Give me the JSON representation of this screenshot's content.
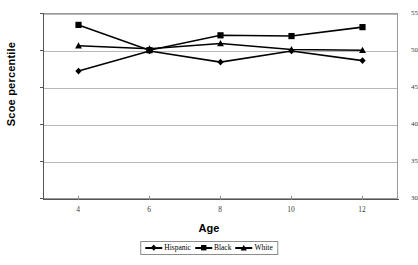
{
  "chart_data": {
    "type": "line",
    "title": "",
    "xlabel": "Age",
    "ylabel": "Scoe percentile",
    "x": [
      4,
      6,
      8,
      10,
      12
    ],
    "xticklabels": [
      "4",
      "6",
      "8",
      "10",
      "12"
    ],
    "yticklabels": [
      "30",
      "35",
      "40",
      "45",
      "50",
      "55"
    ],
    "yticks": [
      30,
      35,
      40,
      45,
      50,
      55
    ],
    "ylim": [
      30,
      55
    ],
    "xlim": [
      3,
      13
    ],
    "grid": "horizontal",
    "legend_position": "bottom",
    "series": [
      {
        "name": "Hispanic",
        "marker": "diamond",
        "values": [
          47.2,
          49.9,
          48.4,
          49.9,
          48.6
        ]
      },
      {
        "name": "Black",
        "marker": "square",
        "values": [
          53.4,
          50.0,
          52.0,
          51.9,
          53.1
        ]
      },
      {
        "name": "White",
        "marker": "triangle",
        "values": [
          50.6,
          50.2,
          50.9,
          50.1,
          50.0
        ]
      }
    ]
  },
  "legend": {
    "entries": [
      {
        "label": "Hispanic"
      },
      {
        "label": "Black"
      },
      {
        "label": "White"
      }
    ]
  },
  "colors": {
    "series": "#000000",
    "grid": "#b8b8b8",
    "axis": "#555555",
    "background": "#ffffff"
  }
}
